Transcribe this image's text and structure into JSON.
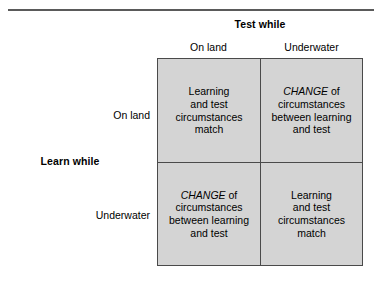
{
  "figure": {
    "type": "two-by-two-matrix",
    "column_group_label": "Test while",
    "row_group_label": "Learn while",
    "column_headers": [
      "On land",
      "Underwater"
    ],
    "row_headers": [
      "On land",
      "Underwater"
    ],
    "cell_background_color": "#d4d4d4",
    "border_color": "#4a4a4a",
    "rule_color": "#5a5a5a",
    "cells": [
      {
        "row": "On land",
        "column": "On land",
        "emphasis": "",
        "lines": [
          "Learning",
          "and test",
          "circumstances",
          "match"
        ],
        "plain_text": "Learning and test circumstances match"
      },
      {
        "row": "On land",
        "column": "Underwater",
        "emphasis": "CHANGE",
        "lines": [
          "of",
          "circumstances",
          "between learning",
          "and test"
        ],
        "plain_text": "CHANGE of circumstances between learning and test"
      },
      {
        "row": "Underwater",
        "column": "On land",
        "emphasis": "CHANGE",
        "lines": [
          "of",
          "circumstances",
          "between learning",
          "and test"
        ],
        "plain_text": "CHANGE of circumstances between learning and test"
      },
      {
        "row": "Underwater",
        "column": "Underwater",
        "emphasis": "",
        "lines": [
          "Learning",
          "and test",
          "circumstances",
          "match"
        ],
        "plain_text": "Learning and test circumstances match"
      }
    ]
  }
}
